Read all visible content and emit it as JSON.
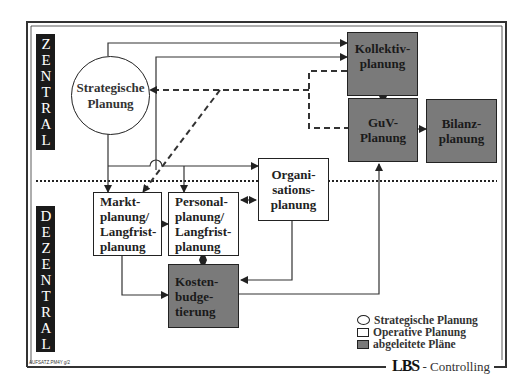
{
  "diagram": {
    "zones": {
      "top": "ZENTRAL",
      "bottom": "DEZENTRAL"
    },
    "nodes": {
      "strategic": {
        "line1": "Strategische",
        "line2": "Planung",
        "type": "strategic"
      },
      "kollektiv": {
        "line1": "Kollektiv-",
        "line2": "planung",
        "type": "derived"
      },
      "guv": {
        "line1": "GuV-",
        "line2": "Planung",
        "type": "derived"
      },
      "bilanz": {
        "line1": "Bilanz-",
        "line2": "planung",
        "type": "derived"
      },
      "organisation": {
        "line1": "Organi-",
        "line2": "sations-",
        "line3": "planung",
        "type": "operative"
      },
      "markt": {
        "line1": "Markt-",
        "line2": "planung/",
        "line3": "Langfrist-",
        "line4": "planung",
        "type": "operative"
      },
      "personal": {
        "line1": "Personal-",
        "line2": "planung/",
        "line3": "Langfrist-",
        "line4": "planung",
        "type": "operative"
      },
      "kosten": {
        "line1": "Kosten-",
        "line2": "budge-",
        "line3": "tierung",
        "type": "derived"
      }
    },
    "legend": [
      {
        "shape": "circle",
        "label": "Strategische Planung"
      },
      {
        "shape": "white-square",
        "label": "Operative Planung"
      },
      {
        "shape": "gray-square",
        "label": "abgeleitete Pläne"
      }
    ],
    "footer": {
      "logo": "LBS",
      "text": "- Controlling"
    },
    "doc_ref": "AUFSATZ.PM4Y g/2",
    "colors": {
      "derived_fill": "#7a7a7a",
      "operative_fill": "#ffffff",
      "line": "#222222",
      "label_bg": "#1a1a1a"
    }
  }
}
